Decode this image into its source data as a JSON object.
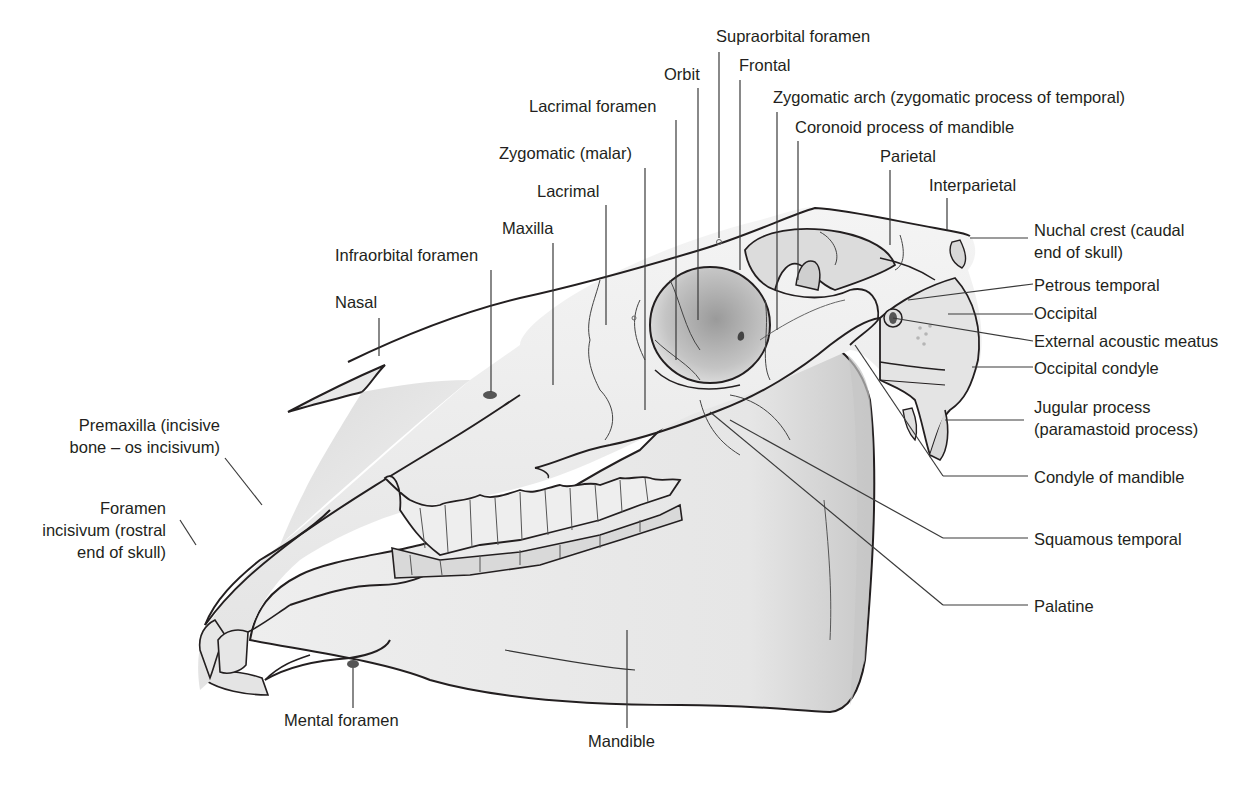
{
  "figure": {
    "colors": {
      "background": "#ffffff",
      "bone_light": "#f2f2f2",
      "bone_mid": "#d9d9d9",
      "bone_shadow": "#a6a6a6",
      "outline": "#231f20",
      "leader_line": "#3a3a3a"
    }
  },
  "labels": {
    "supraorbital_foramen": "Supraorbital foramen",
    "orbit": "Orbit",
    "frontal": "Frontal",
    "zygomatic_arch": "Zygomatic arch (zygomatic process of temporal)",
    "lacrimal_foramen": "Lacrimal foramen",
    "coronoid_process": "Coronoid process of mandible",
    "zygomatic_malar": "Zygomatic (malar)",
    "parietal": "Parietal",
    "lacrimal": "Lacrimal",
    "interparietal": "Interparietal",
    "maxilla": "Maxilla",
    "nuchal_crest_1": "Nuchal crest (caudal",
    "nuchal_crest_2": "end of skull)",
    "infraorbital_foramen": "Infraorbital foramen",
    "petrous_temporal": "Petrous temporal",
    "nasal": "Nasal",
    "occipital": "Occipital",
    "external_acoustic_meatus": "External acoustic meatus",
    "occipital_condyle": "Occipital condyle",
    "jugular_process_1": "Jugular process",
    "jugular_process_2": "(paramastoid process)",
    "premaxilla_1": "Premaxilla (incisive",
    "premaxilla_2": "bone – os incisivum)",
    "condyle_of_mandible": "Condyle of mandible",
    "foramen_incisivum_1": "Foramen",
    "foramen_incisivum_2": "incisivum (rostral",
    "foramen_incisivum_3": "end of skull)",
    "squamous_temporal": "Squamous temporal",
    "palatine": "Palatine",
    "mental_foramen": "Mental foramen",
    "mandible": "Mandible"
  }
}
